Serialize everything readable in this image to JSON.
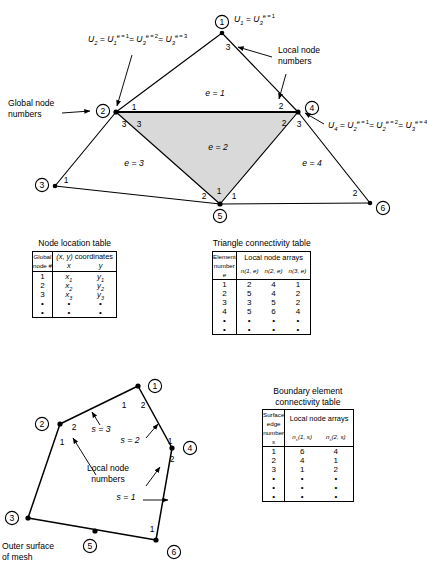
{
  "figure": {
    "top_diagram": {
      "name": "triangular-element-mesh-diagram",
      "global_nodes": [
        {
          "id": "1",
          "label": "1",
          "x": 222,
          "y": 22
        },
        {
          "id": "2",
          "label": "2",
          "x": 103,
          "y": 111
        },
        {
          "id": "3",
          "label": "3",
          "x": 42,
          "y": 185
        },
        {
          "id": "4",
          "label": "4",
          "x": 312,
          "y": 108
        },
        {
          "id": "5",
          "label": "5",
          "x": 220,
          "y": 210
        },
        {
          "id": "6",
          "label": "6",
          "x": 380,
          "y": 207
        }
      ],
      "elements": [
        {
          "label": "e = 1",
          "x": 215,
          "y": 93
        },
        {
          "label": "e = 2",
          "x": 218,
          "y": 147
        },
        {
          "label": "e = 3",
          "x": 134,
          "y": 163
        },
        {
          "label": "e = 4",
          "x": 312,
          "y": 163
        }
      ],
      "local_numbers": [
        {
          "label": "3",
          "x": 228,
          "y": 46
        },
        {
          "label": "1",
          "x": 134,
          "y": 107
        },
        {
          "label": "3",
          "x": 124,
          "y": 123
        },
        {
          "label": "3",
          "x": 139,
          "y": 123
        },
        {
          "label": "2",
          "x": 281,
          "y": 105
        },
        {
          "label": "2",
          "x": 284,
          "y": 122
        },
        {
          "label": "3",
          "x": 299,
          "y": 123
        },
        {
          "label": "1",
          "x": 62,
          "y": 178
        },
        {
          "label": "2",
          "x": 202,
          "y": 194
        },
        {
          "label": "1",
          "x": 217,
          "y": 189
        },
        {
          "label": "1",
          "x": 232,
          "y": 194
        },
        {
          "label": "2",
          "x": 355,
          "y": 192
        }
      ],
      "annotations": {
        "global_node_numbers": "Global node\nnumbers",
        "global_node_numbers_line1": "Global node",
        "global_node_numbers_line2": "numbers",
        "local_node_numbers_line1": "Local node",
        "local_node_numbers_line2": "numbers"
      },
      "equations": {
        "node1": {
          "lhs": "U",
          "lhs_sub": "1",
          "terms": [
            {
              "base": "U",
              "sub": "3",
              "sup": "e = 1"
            }
          ]
        },
        "node2": {
          "lhs": "U",
          "lhs_sub": "2",
          "terms": [
            {
              "base": "U",
              "sub": "1",
              "sup": "e = 1"
            },
            {
              "base": "U",
              "sub": "3",
              "sup": "e = 2"
            },
            {
              "base": "U",
              "sub": "3",
              "sup": "e = 3"
            }
          ]
        },
        "node4": {
          "lhs": "U",
          "lhs_sub": "4",
          "terms": [
            {
              "base": "U",
              "sub": "2",
              "sup": "e = 1"
            },
            {
              "base": "U",
              "sub": "2",
              "sup": "e = 2"
            },
            {
              "base": "U",
              "sub": "3",
              "sup": "e = 4"
            }
          ]
        }
      },
      "shaded_element_color": "#d9d9d9"
    },
    "node_location_table": {
      "title": "Node location table",
      "header_col1_line1": "Global",
      "header_col1_line2": "node #",
      "header_group": "(x, y) coordinates",
      "header_x": "x",
      "header_y": "y",
      "rows": [
        {
          "node": "1",
          "x": "x",
          "x_sub": "1",
          "y": "y",
          "y_sub": "1"
        },
        {
          "node": "2",
          "x": "x",
          "x_sub": "2",
          "y": "y",
          "y_sub": "2"
        },
        {
          "node": "3",
          "x": "x",
          "x_sub": "3",
          "y": "y",
          "y_sub": "3"
        }
      ],
      "continuation_rows": 2,
      "continuation_glyph": "•"
    },
    "triangle_connectivity_table": {
      "title": "Triangle connectivity table",
      "header_col1_line1": "Element",
      "header_col1_line2": "number",
      "header_col1_line3": "e",
      "header_group": "Local node arrays",
      "col_headers": [
        "n(1, e)",
        "n(2, e)",
        "n(3, e)"
      ],
      "rows": [
        {
          "element": "1",
          "n1": "2",
          "n2": "4",
          "n3": "1"
        },
        {
          "element": "2",
          "n1": "5",
          "n2": "4",
          "n3": "2"
        },
        {
          "element": "3",
          "n1": "3",
          "n2": "5",
          "n3": "2"
        },
        {
          "element": "4",
          "n1": "5",
          "n2": "6",
          "n3": "4"
        }
      ],
      "continuation_rows": 2,
      "continuation_glyph": "•"
    },
    "boundary_element_table": {
      "title_line1": "Boundary element",
      "title_line2": "connectivity table",
      "header_col1_line1": "Surface",
      "header_col1_line2": "edge",
      "header_col1_line3": "number",
      "header_col1_line4": "s",
      "header_group": "Local node arrays",
      "col_headers": [
        "n",
        "n"
      ],
      "col_header_subs": [
        "s",
        "s"
      ],
      "col_header_args": [
        "(1, s)",
        "(2, s)"
      ],
      "rows": [
        {
          "edge": "1",
          "n1": "6",
          "n2": "4"
        },
        {
          "edge": "2",
          "n1": "4",
          "n2": "1"
        },
        {
          "edge": "3",
          "n1": "1",
          "n2": "2"
        }
      ],
      "continuation_rows": 3,
      "continuation_glyph": "•"
    },
    "bottom_diagram": {
      "name": "outer-surface-boundary-diagram",
      "global_nodes": [
        {
          "id": "1",
          "label": "1",
          "x": 158,
          "y": 24
        },
        {
          "id": "2",
          "label": "2",
          "x": 42,
          "y": 62
        },
        {
          "id": "3",
          "label": "3",
          "x": 12,
          "y": 156
        },
        {
          "id": "4",
          "label": "4",
          "x": 203,
          "y": 86
        },
        {
          "id": "5",
          "label": "5",
          "x": 89,
          "y": 178
        },
        {
          "id": "6",
          "label": "6",
          "x": 177,
          "y": 179
        }
      ],
      "surface_edges": [
        {
          "label": "s = 3",
          "x": 97,
          "y": 67
        },
        {
          "label": "s = 2",
          "x": 123,
          "y": 78
        },
        {
          "label": "s = 1",
          "x": 120,
          "y": 135
        }
      ],
      "local_numbers": [
        {
          "label": "1",
          "x": 124,
          "y": 42
        },
        {
          "label": "2",
          "x": 141,
          "y": 42
        },
        {
          "label": "2",
          "x": 72,
          "y": 64
        },
        {
          "label": "1",
          "x": 60,
          "y": 79
        },
        {
          "label": "1",
          "x": 171,
          "y": 80
        },
        {
          "label": "2",
          "x": 172,
          "y": 96
        },
        {
          "label": "1",
          "x": 154,
          "y": 168
        }
      ],
      "annotations": {
        "local_node_numbers_line1": "Local node",
        "local_node_numbers_line2": "numbers",
        "outer_surface_line1": "Outer surface",
        "outer_surface_line2": "of mesh"
      }
    }
  }
}
